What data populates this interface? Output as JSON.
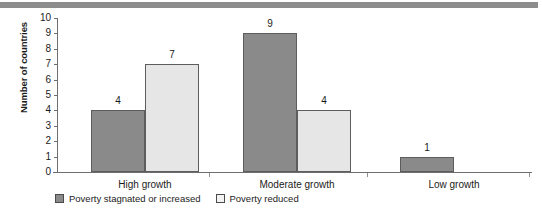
{
  "chart_data": {
    "type": "bar",
    "title": "",
    "subtitle": "",
    "xlabel": "",
    "ylabel": "Number of countries",
    "ylim": [
      0,
      10
    ],
    "ytick_labels": [
      "10",
      "9",
      "8",
      "7",
      "6",
      "5",
      "4",
      "3",
      "2",
      "1",
      "0"
    ],
    "ytick_values": [
      10,
      9,
      8,
      7,
      6,
      5,
      4,
      3,
      2,
      1,
      0
    ],
    "grid": false,
    "legend_position": "bottom-left",
    "categories": [
      "High growth",
      "Moderate growth",
      "Low growth"
    ],
    "series": [
      {
        "name": "Poverty stagnated or increased",
        "color": "#8a8a8a",
        "values": [
          4,
          9,
          1
        ],
        "labels": [
          "4",
          "9",
          "1"
        ]
      },
      {
        "name": "Poverty reduced",
        "color": "#e6e6e6",
        "values": [
          7,
          4,
          0
        ],
        "labels": [
          "7",
          "4",
          ""
        ]
      }
    ]
  },
  "legend": {
    "items": [
      {
        "label": "Poverty stagnated or increased",
        "swatch": "dark"
      },
      {
        "label": "Poverty reduced",
        "swatch": "light"
      }
    ]
  }
}
